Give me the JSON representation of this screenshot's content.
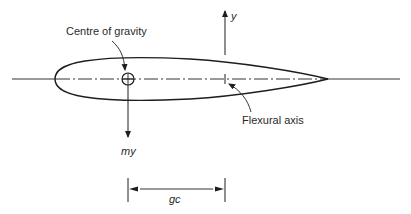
{
  "diagram": {
    "labels": {
      "centre_of_gravity": "Centre of gravity",
      "flexural_axis": "Flexural axis",
      "displacement": "y",
      "inertia_force": "my",
      "offset_dimension": "gc"
    },
    "colors": {
      "line": "#1e1e1e",
      "text": "#2a2a2a",
      "background": "#ffffff"
    }
  }
}
